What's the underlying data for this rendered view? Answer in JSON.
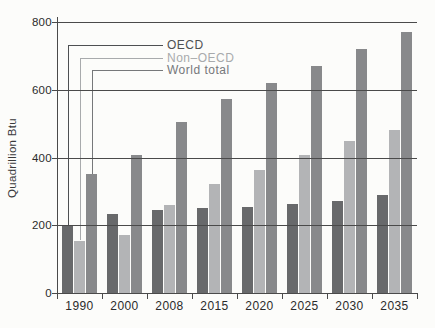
{
  "chart_data": {
    "type": "bar",
    "title": "",
    "ylabel": "Quadrillion Btu",
    "xlabel": "",
    "ylim": [
      0,
      800
    ],
    "yticks": [
      0,
      200,
      400,
      600,
      800
    ],
    "grid": "horizontal",
    "legend_position": "top-left with leader lines to 1990 bars",
    "categories": [
      "1990",
      "2000",
      "2008",
      "2015",
      "2020",
      "2025",
      "2030",
      "2035"
    ],
    "series": [
      {
        "name": "OECD",
        "color": "#68696b",
        "label_color": "#4e5052",
        "values": [
          197,
          234,
          244,
          251,
          255,
          263,
          271,
          288
        ]
      },
      {
        "name": "Non–OECD",
        "color": "#b3b4b6",
        "label_color": "#a8aaac",
        "values": [
          155,
          171,
          260,
          322,
          364,
          408,
          450,
          482
        ]
      },
      {
        "name": "World total",
        "color": "#88898b",
        "label_color": "#76787a",
        "values": [
          352,
          406,
          505,
          573,
          619,
          671,
          721,
          770
        ]
      }
    ]
  },
  "colors": {
    "background": "#fcfcfa",
    "axis": "#4a4a4a",
    "tick_text": "#2b2b2b"
  }
}
